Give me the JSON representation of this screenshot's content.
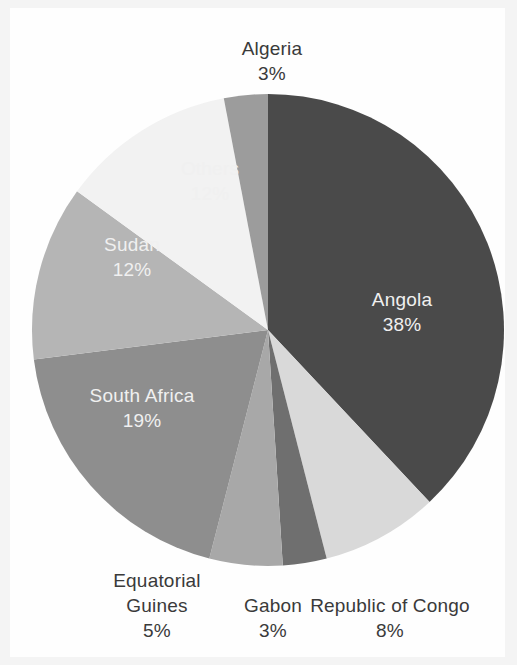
{
  "chart_data": {
    "type": "pie",
    "title": "",
    "subtitle": "",
    "xlabel": "",
    "ylabel": "",
    "legend_position": "none",
    "grid": false,
    "unit": "%",
    "start_angle_deg": 0,
    "direction": "clockwise",
    "categories": [
      "Angola",
      "Republic of Congo",
      "Gabon",
      "Equatorial Guines",
      "South Africa",
      "Sudan",
      "Others",
      "Algeria"
    ],
    "values": [
      38,
      8,
      3,
      5,
      19,
      12,
      12,
      3
    ],
    "slices": [
      {
        "name": "angola",
        "label": "Angola",
        "value": 38,
        "value_text": "38%",
        "color": "#4a4a4a",
        "label_placement": "inside",
        "label_color": "#f0f0f0"
      },
      {
        "name": "republic-of-congo",
        "label": "Republic of Congo",
        "value": 8,
        "value_text": "8%",
        "color": "#d9d9d9",
        "label_placement": "outside",
        "label_color": "#3a3a3a"
      },
      {
        "name": "gabon",
        "label": "Gabon",
        "value": 3,
        "value_text": "3%",
        "color": "#6f6f6f",
        "label_placement": "outside",
        "label_color": "#3a3a3a"
      },
      {
        "name": "equatorial-guines",
        "label": "Equatorial Guines",
        "value": 5,
        "value_text": "5%",
        "color": "#a8a8a8",
        "label_placement": "outside",
        "label_color": "#3a3a3a"
      },
      {
        "name": "south-africa",
        "label": "South Africa",
        "value": 19,
        "value_text": "19%",
        "color": "#8e8e8e",
        "label_placement": "inside",
        "label_color": "#3a3a3a"
      },
      {
        "name": "sudan",
        "label": "Sudan",
        "value": 12,
        "value_text": "12%",
        "color": "#b5b5b5",
        "label_placement": "inside",
        "label_color": "#3a3a3a"
      },
      {
        "name": "others",
        "label": "Others",
        "value": 12,
        "value_text": "12%",
        "color": "#f2f2f2",
        "label_placement": "inside",
        "label_color": "#3a3a3a"
      },
      {
        "name": "algeria",
        "label": "Algeria",
        "value": 3,
        "value_text": "3%",
        "color": "#9c9c9c",
        "label_placement": "outside",
        "label_color": "#3a3a3a"
      }
    ],
    "geometry": {
      "center_x": 268,
      "center_y": 330,
      "radius": 236
    },
    "colors": {
      "background": "#fefefe",
      "frame": "#f4f4f4",
      "label_text": "#3a3a3a",
      "label_text_inverse": "#f0f0f0"
    }
  }
}
